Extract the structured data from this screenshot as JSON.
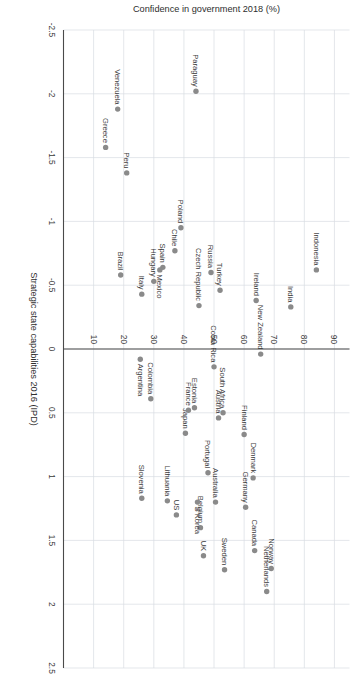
{
  "chart_data": {
    "type": "scatter",
    "title": "",
    "xlabel": "Strategic state capabilities 2016 (IPD)",
    "ylabel": "Confidence in government 2018 (%)",
    "xlim": [
      -2.5,
      2.5
    ],
    "ylim": [
      0,
      95
    ],
    "xticks": [
      -2.5,
      -2,
      -1.5,
      -1,
      -0.5,
      0,
      0.5,
      1,
      1.5,
      2,
      2.5
    ],
    "xticklabels": [
      "-2.5",
      "-2",
      "-1.5",
      "-1",
      "-0.5",
      "0",
      "0.5",
      "1",
      "1.5",
      "2",
      "2.5"
    ],
    "yticks": [
      10,
      20,
      30,
      40,
      50,
      60,
      70,
      80,
      90
    ],
    "yticklabels": [
      "10",
      "20",
      "30",
      "40",
      "50",
      "60",
      "70",
      "80",
      "90"
    ],
    "grid": true,
    "legend": "none",
    "rotation_deg": 90,
    "marker_color": "#8a8a8a",
    "points": [
      {
        "label": "Indonesia",
        "x": -0.62,
        "y": 84.0,
        "lp": "left"
      },
      {
        "label": "India",
        "x": -0.33,
        "y": 75.5,
        "lp": "left"
      },
      {
        "label": "Ireland",
        "x": -0.38,
        "y": 64.0,
        "lp": "left"
      },
      {
        "label": "New Zealand",
        "x": 0.04,
        "y": 65.5,
        "lp": "left"
      },
      {
        "label": "Turkey",
        "x": -0.46,
        "y": 52.0,
        "lp": "left"
      },
      {
        "label": "Russia",
        "x": -0.6,
        "y": 49.0,
        "lp": "left"
      },
      {
        "label": "Czech Republic",
        "x": -0.34,
        "y": 45.0,
        "lp": "left"
      },
      {
        "label": "Poland",
        "x": -0.95,
        "y": 39.0,
        "lp": "left"
      },
      {
        "label": "Chile",
        "x": -0.77,
        "y": 37.0,
        "lp": "left"
      },
      {
        "label": "Spain",
        "x": -0.64,
        "y": 33.0,
        "lp": "left"
      },
      {
        "label": "Mexico",
        "x": -0.62,
        "y": 32.0,
        "lp": "right"
      },
      {
        "label": "Hungary",
        "x": -0.53,
        "y": 30.0,
        "lp": "left"
      },
      {
        "label": "Italy",
        "x": -0.43,
        "y": 26.0,
        "lp": "left"
      },
      {
        "label": "Brazil",
        "x": -0.58,
        "y": 19.0,
        "lp": "left"
      },
      {
        "label": "Peru",
        "x": -1.38,
        "y": 21.0,
        "lp": "left"
      },
      {
        "label": "Venezuela",
        "x": -1.88,
        "y": 18.0,
        "lp": "left"
      },
      {
        "label": "Greece",
        "x": -1.58,
        "y": 14.0,
        "lp": "left"
      },
      {
        "label": "Paraguay",
        "x": -2.02,
        "y": 44.0,
        "lp": "left"
      },
      {
        "label": "Norway",
        "x": 1.72,
        "y": 69.0,
        "lp": "left"
      },
      {
        "label": "Netherlands",
        "x": 1.9,
        "y": 67.5,
        "lp": "left"
      },
      {
        "label": "Canada",
        "x": 1.58,
        "y": 63.5,
        "lp": "left"
      },
      {
        "label": "Sweden",
        "x": 1.73,
        "y": 53.5,
        "lp": "left"
      },
      {
        "label": "UK",
        "x": 1.62,
        "y": 46.5,
        "lp": "left"
      },
      {
        "label": "Germany",
        "x": 1.24,
        "y": 60.5,
        "lp": "left"
      },
      {
        "label": "Denmark",
        "x": 1.01,
        "y": 63.0,
        "lp": "left"
      },
      {
        "label": "Finland",
        "x": 0.67,
        "y": 60.0,
        "lp": "left"
      },
      {
        "label": "South Africa",
        "x": 0.5,
        "y": 53.0,
        "lp": "left"
      },
      {
        "label": "Austria",
        "x": 0.54,
        "y": 51.5,
        "lp": "left"
      },
      {
        "label": "Costa Rica",
        "x": 0.14,
        "y": 50.0,
        "lp": "left"
      },
      {
        "label": "Australia",
        "x": 1.2,
        "y": 50.5,
        "lp": "left"
      },
      {
        "label": "Portugal",
        "x": 0.97,
        "y": 48.0,
        "lp": "left"
      },
      {
        "label": "Belgium",
        "x": 1.4,
        "y": 45.5,
        "lp": "left"
      },
      {
        "label": "S Korea",
        "x": 1.2,
        "y": 44.5,
        "lp": "right"
      },
      {
        "label": "Japan",
        "x": 0.66,
        "y": 40.5,
        "lp": "left"
      },
      {
        "label": "Estonia",
        "x": 0.46,
        "y": 43.5,
        "lp": "left"
      },
      {
        "label": "France",
        "x": 0.48,
        "y": 41.5,
        "lp": "left"
      },
      {
        "label": "US",
        "x": 1.3,
        "y": 37.5,
        "lp": "left"
      },
      {
        "label": "Lithuania",
        "x": 1.19,
        "y": 34.5,
        "lp": "left"
      },
      {
        "label": "Slovenia",
        "x": 1.17,
        "y": 26.0,
        "lp": "left"
      },
      {
        "label": "Colombia",
        "x": 0.39,
        "y": 29.0,
        "lp": "left"
      },
      {
        "label": "Argentina",
        "x": 0.08,
        "y": 25.5,
        "lp": "right"
      }
    ]
  }
}
